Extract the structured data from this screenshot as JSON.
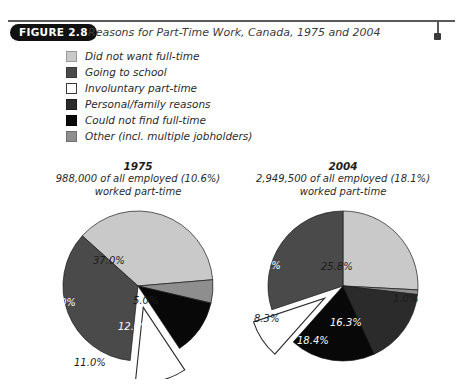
{
  "header": {
    "badge": "FIGURE 2.8",
    "title": "Reasons for Part-Time Work, Canada, 1975 and 2004",
    "rule_icon": "horizontal-rule",
    "end_marker_icon": "square-marker-icon"
  },
  "legend": {
    "items": [
      {
        "label": "Did not want full-time",
        "color": "#c9c9c9",
        "border": "#9a9a9a"
      },
      {
        "label": "Going to school",
        "color": "#4a4a4a",
        "border": "#3a3a3a"
      },
      {
        "label": "Involuntary part-time",
        "color": "#ffffff",
        "border": "#3a3a3a"
      },
      {
        "label": "Personal/family reasons",
        "color": "#2b2b2b",
        "border": "#1c1c1c"
      },
      {
        "label": "Could not find full-time",
        "color": "#080808",
        "border": "#000000"
      },
      {
        "label": "Other (incl. multiple jobholders)",
        "color": "#8e8e8e",
        "border": "#6f6f6f"
      }
    ]
  },
  "chart_data": [
    {
      "type": "pie",
      "title": "1975",
      "subtitle_line1": "988,000 of all employed (10.6%)",
      "subtitle_line2": "worked part-time",
      "categories": [
        "Did not want full-time",
        "Other (incl. multiple jobholders)",
        "Could not find full-time",
        "Involuntary part-time",
        "Going to school"
      ],
      "values": [
        37.0,
        5.0,
        12.0,
        11.0,
        35.0
      ],
      "labels": [
        "37.0%",
        "5.0%",
        "12.0%",
        "11.0%",
        "35.0%"
      ],
      "colors": [
        "#c9c9c9",
        "#8e8e8e",
        "#080808",
        "#ffffff",
        "#4a4a4a"
      ],
      "exploded": "Involuntary part-time",
      "legend_position": "top",
      "grid": false
    },
    {
      "type": "pie",
      "title": "2004",
      "subtitle_line1": "2,949,500 of all employed (18.1%)",
      "subtitle_line2": "worked part-time",
      "categories": [
        "Did not want full-time",
        "Other (incl. multiple jobholders)",
        "Personal/family reasons",
        "Could not find full-time",
        "Involuntary part-time",
        "Going to school"
      ],
      "values": [
        25.8,
        1.0,
        16.3,
        18.4,
        8.3,
        30.1
      ],
      "labels": [
        "25.8%",
        "1.0%",
        "16.3%",
        "18.4%",
        "8.3%",
        "30.1%"
      ],
      "colors": [
        "#c9c9c9",
        "#8e8e8e",
        "#2b2b2b",
        "#080808",
        "#ffffff",
        "#4a4a4a"
      ],
      "exploded": "Involuntary part-time",
      "legend_position": "top",
      "grid": false
    }
  ],
  "pie1975": {
    "year": "1975",
    "sub1": "988,000 of all employed (10.6%)",
    "sub2": "worked part-time",
    "l0": "37.0%",
    "l1": "5.0%",
    "l2": "12.0%",
    "l3": "11.0%",
    "l4": "35.0%"
  },
  "pie2004": {
    "year": "2004",
    "sub1": "2,949,500 of all employed (18.1%)",
    "sub2": "worked part-time",
    "l0": "25.8%",
    "l1": "1.0%",
    "l2": "16.3%",
    "l3": "18.4%",
    "l4": "8.3%",
    "l5": "30.1%"
  }
}
